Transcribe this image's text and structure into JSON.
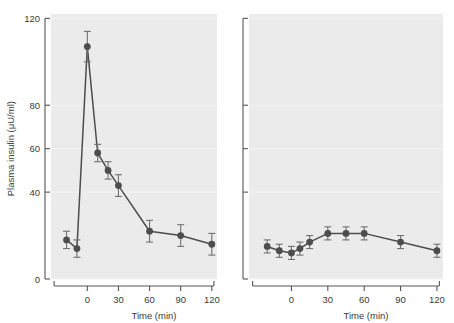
{
  "figure": {
    "background_color": "#ffffff",
    "panel_background_color": "#ebebeb",
    "marker_color": "#4d4d4d",
    "line_color": "#4d4d4d",
    "error_bar_color": "#707070",
    "axis_color": "#555555"
  },
  "chart_data": [
    {
      "type": "line",
      "panel": "left",
      "title": "",
      "xlabel": "Time (min)",
      "ylabel": "Plasma insulin (μU/ml)",
      "xlim": [
        -35,
        125
      ],
      "ylim": [
        0,
        122
      ],
      "xticks": [
        0,
        30,
        60,
        90,
        120
      ],
      "xticklabels": [
        "0",
        "30",
        "60",
        "90",
        "120"
      ],
      "yticks": [
        0,
        40,
        60,
        80,
        120
      ],
      "yticklabels": [
        "0",
        "40",
        "60",
        "80",
        "120"
      ],
      "grid": true,
      "legend": "none",
      "series": [
        {
          "name": "Plasma insulin",
          "x": [
            -20,
            -10,
            0,
            10,
            20,
            30,
            60,
            90,
            120
          ],
          "values": [
            18,
            14,
            107,
            58,
            50,
            43,
            22,
            20,
            16
          ],
          "errors": [
            4,
            4,
            7,
            4,
            4,
            5,
            5,
            5,
            5
          ]
        }
      ]
    },
    {
      "type": "line",
      "panel": "right",
      "title": "",
      "xlabel": "Time (min)",
      "ylabel": "",
      "xlim": [
        -35,
        125
      ],
      "ylim": [
        0,
        122
      ],
      "xticks": [
        0,
        30,
        60,
        90,
        120
      ],
      "xticklabels": [
        "0",
        "30",
        "60",
        "90",
        "120"
      ],
      "yticks": [
        0,
        40,
        60,
        80,
        120
      ],
      "yticklabels": [],
      "grid": true,
      "legend": "none",
      "series": [
        {
          "name": "Plasma insulin",
          "x": [
            -20,
            -10,
            0,
            7,
            15,
            30,
            45,
            60,
            90,
            120
          ],
          "values": [
            15,
            13,
            12,
            14,
            17,
            21,
            21,
            21,
            17,
            13
          ],
          "errors": [
            3,
            3,
            3,
            3,
            3,
            3,
            3,
            3,
            3,
            3
          ]
        }
      ]
    }
  ]
}
